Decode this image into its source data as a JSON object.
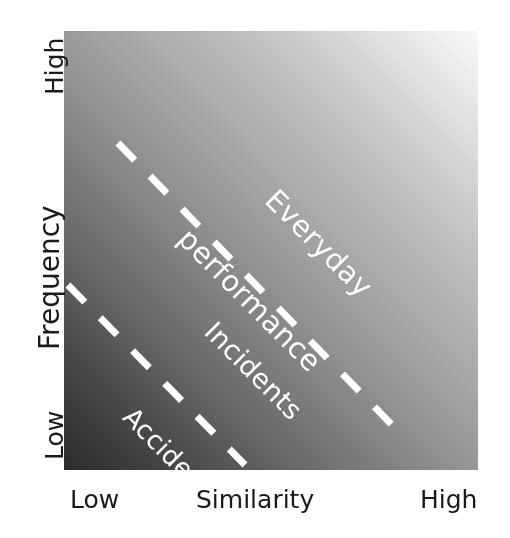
{
  "figure": {
    "kind": "conceptual-diagram",
    "background_color": "#ffffff"
  },
  "y_axis": {
    "title": "Frequency",
    "high_label": "High",
    "low_label": "Low"
  },
  "x_axis": {
    "title": "Similarity",
    "low_label": "Low",
    "high_label": "High"
  },
  "regions": [
    {
      "name": "everyday-performance",
      "line1": "Everyday",
      "line2": "performance",
      "color": "#ffffff"
    },
    {
      "name": "incidents",
      "label": "Incidents",
      "color": "#ffffff"
    },
    {
      "name": "accidents",
      "label": "Accidents",
      "color": "#ffffff"
    }
  ],
  "boundaries": {
    "dash_color": "#ffffff",
    "upper": {
      "x1": 54,
      "y1": 112,
      "x2": 331,
      "y2": 397
    },
    "lower": {
      "x1": 4,
      "y1": 254,
      "x2": 181,
      "y2": 434
    }
  },
  "chart_data": {
    "type": "heatmap",
    "title": "",
    "xlabel": "Similarity",
    "ylabel": "Frequency",
    "xtick_labels": [
      "Low",
      "High"
    ],
    "ytick_labels": [
      "Low",
      "High"
    ],
    "grid": false,
    "legend_position": "none",
    "colorscale": {
      "from": "#2c2c2c",
      "to": "#ffffff",
      "direction": "diagonal bottom-left (dark) to top-right (light)"
    },
    "annotations": [
      {
        "text": "Everyday performance",
        "region": "upper-right",
        "rotation_deg": 45,
        "color": "#ffffff"
      },
      {
        "text": "Incidents",
        "region": "middle-band",
        "rotation_deg": 45,
        "color": "#ffffff"
      },
      {
        "text": "Accidents",
        "region": "lower-left",
        "rotation_deg": 45,
        "color": "#ffffff"
      }
    ],
    "series": [
      {
        "name": "upper boundary (everyday / incidents)",
        "style": "white dashed",
        "slope_deg": -45
      },
      {
        "name": "lower boundary (incidents / accidents)",
        "style": "white dashed",
        "slope_deg": -45
      }
    ]
  }
}
